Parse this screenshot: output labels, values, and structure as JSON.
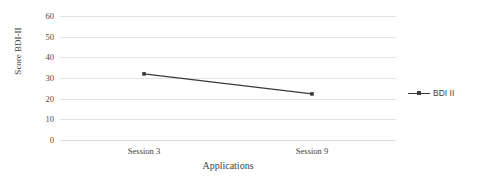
{
  "chart_data": {
    "type": "line",
    "title": "",
    "xlabel": "Applications",
    "ylabel": "Score BDI-II",
    "categories": [
      "Session 3",
      "Session 9"
    ],
    "series": [
      {
        "name": "BDI II",
        "values": [
          32,
          22.3
        ],
        "color": "#3a3a3a",
        "marker": "square"
      }
    ],
    "ylim": [
      0,
      60
    ],
    "yticks": [
      0,
      10,
      20,
      30,
      40,
      50,
      60
    ],
    "ytick_labels": [
      "0",
      "10",
      "20",
      "30",
      "40",
      "50",
      "60"
    ],
    "grid": true,
    "grid_color": "#e4e4e4",
    "legend_position": "right",
    "legend_entries": [
      "BDI II"
    ]
  },
  "legend": {
    "entry_label": "BDI II"
  },
  "axes": {
    "y_title": "Score BDI-II",
    "x_title": "Applications"
  }
}
